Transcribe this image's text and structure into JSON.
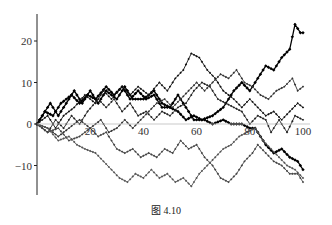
{
  "caption": "图 4.10",
  "chart_data": {
    "type": "line",
    "title": "",
    "caption": "图 4.10",
    "xlabel": "",
    "ylabel": "",
    "xlim": [
      0,
      100
    ],
    "ylim": [
      -17,
      27
    ],
    "x_ticks": [
      20,
      40,
      60,
      80,
      100
    ],
    "x_tick_labels": [
      "20",
      "40",
      "60",
      "80",
      "100"
    ],
    "y_ticks": [
      -10,
      0,
      10,
      20
    ],
    "y_tick_labels": [
      "-10",
      "0",
      "10",
      "20"
    ],
    "grid": false,
    "legend": null,
    "marker": "diamond",
    "series": [
      {
        "name": "walk-1",
        "color": "#000000",
        "weight": "bold",
        "waypoints": [
          [
            0,
            0
          ],
          [
            5,
            5
          ],
          [
            8,
            2
          ],
          [
            14,
            8
          ],
          [
            17,
            5
          ],
          [
            20,
            8
          ],
          [
            23,
            5
          ],
          [
            26,
            8
          ],
          [
            30,
            6
          ],
          [
            33,
            9
          ],
          [
            36,
            6
          ],
          [
            40,
            6
          ],
          [
            44,
            8
          ],
          [
            47,
            5
          ],
          [
            50,
            4
          ],
          [
            53,
            7
          ],
          [
            56,
            4
          ],
          [
            59,
            1
          ],
          [
            63,
            1
          ],
          [
            66,
            0
          ],
          [
            70,
            1
          ],
          [
            73,
            0
          ],
          [
            77,
            0
          ],
          [
            80,
            -1
          ],
          [
            82,
            -1
          ],
          [
            86,
            -5
          ],
          [
            89,
            -7
          ],
          [
            92,
            -6
          ],
          [
            95,
            -8
          ],
          [
            98,
            -9
          ],
          [
            100,
            -11
          ]
        ]
      },
      {
        "name": "walk-2",
        "color": "#000000",
        "weight": "bold",
        "waypoints": [
          [
            0,
            0
          ],
          [
            3,
            3
          ],
          [
            6,
            2
          ],
          [
            9,
            5
          ],
          [
            13,
            7
          ],
          [
            16,
            5
          ],
          [
            19,
            7
          ],
          [
            22,
            6
          ],
          [
            26,
            9
          ],
          [
            29,
            7
          ],
          [
            32,
            9
          ],
          [
            35,
            6
          ],
          [
            38,
            8
          ],
          [
            41,
            6
          ],
          [
            44,
            7
          ],
          [
            47,
            4
          ],
          [
            50,
            4
          ],
          [
            53,
            3
          ],
          [
            56,
            1
          ],
          [
            59,
            2
          ],
          [
            62,
            1
          ],
          [
            66,
            2
          ],
          [
            70,
            4
          ],
          [
            74,
            8
          ],
          [
            77,
            10
          ],
          [
            80,
            8
          ],
          [
            84,
            12
          ],
          [
            86,
            14
          ],
          [
            89,
            13
          ],
          [
            92,
            16
          ],
          [
            95,
            18
          ],
          [
            97,
            24
          ],
          [
            99,
            22
          ],
          [
            100,
            22
          ]
        ]
      },
      {
        "name": "walk-3",
        "color": "#111111",
        "weight": "normal",
        "waypoints": [
          [
            0,
            0
          ],
          [
            4,
            2
          ],
          [
            7,
            -1
          ],
          [
            10,
            2
          ],
          [
            14,
            4
          ],
          [
            18,
            7
          ],
          [
            22,
            5
          ],
          [
            25,
            8
          ],
          [
            28,
            6
          ],
          [
            32,
            9
          ],
          [
            35,
            7
          ],
          [
            38,
            9
          ],
          [
            42,
            7
          ],
          [
            46,
            10
          ],
          [
            49,
            8
          ],
          [
            52,
            11
          ],
          [
            55,
            13
          ],
          [
            58,
            17
          ],
          [
            61,
            16
          ],
          [
            64,
            13
          ],
          [
            67,
            11
          ],
          [
            70,
            8
          ],
          [
            74,
            6
          ],
          [
            77,
            4
          ],
          [
            80,
            6
          ],
          [
            83,
            4
          ],
          [
            86,
            2
          ],
          [
            89,
            3
          ],
          [
            92,
            1
          ],
          [
            95,
            3
          ],
          [
            98,
            5
          ],
          [
            100,
            4
          ]
        ]
      },
      {
        "name": "walk-4",
        "color": "#222222",
        "weight": "normal",
        "waypoints": [
          [
            0,
            0
          ],
          [
            4,
            -2
          ],
          [
            7,
            1
          ],
          [
            10,
            -1
          ],
          [
            13,
            2
          ],
          [
            16,
            0
          ],
          [
            19,
            3
          ],
          [
            23,
            6
          ],
          [
            26,
            4
          ],
          [
            29,
            6
          ],
          [
            32,
            3
          ],
          [
            35,
            5
          ],
          [
            38,
            2
          ],
          [
            41,
            3
          ],
          [
            44,
            1
          ],
          [
            47,
            3
          ],
          [
            50,
            2
          ],
          [
            53,
            4
          ],
          [
            56,
            5
          ],
          [
            59,
            8
          ],
          [
            62,
            10
          ],
          [
            65,
            9
          ],
          [
            68,
            6
          ],
          [
            71,
            5
          ],
          [
            74,
            4
          ],
          [
            77,
            3
          ],
          [
            80,
            0
          ],
          [
            83,
            2
          ],
          [
            86,
            1
          ],
          [
            88,
            -2
          ],
          [
            91,
            1
          ],
          [
            94,
            -2
          ],
          [
            97,
            2
          ],
          [
            100,
            1
          ]
        ]
      },
      {
        "name": "walk-5",
        "color": "#333333",
        "weight": "normal",
        "waypoints": [
          [
            0,
            0
          ],
          [
            4,
            -1
          ],
          [
            8,
            -3
          ],
          [
            12,
            -1
          ],
          [
            16,
            1
          ],
          [
            20,
            -1
          ],
          [
            24,
            1
          ],
          [
            27,
            -2
          ],
          [
            30,
            -1
          ],
          [
            33,
            1
          ],
          [
            36,
            -1
          ],
          [
            39,
            1
          ],
          [
            42,
            3
          ],
          [
            45,
            5
          ],
          [
            48,
            6
          ],
          [
            51,
            4
          ],
          [
            54,
            6
          ],
          [
            57,
            8
          ],
          [
            60,
            10
          ],
          [
            63,
            8
          ],
          [
            66,
            10
          ],
          [
            69,
            12
          ],
          [
            72,
            11
          ],
          [
            75,
            13
          ],
          [
            78,
            10
          ],
          [
            81,
            9
          ],
          [
            84,
            7
          ],
          [
            87,
            6
          ],
          [
            90,
            8
          ],
          [
            93,
            9
          ],
          [
            96,
            11
          ],
          [
            98,
            8
          ],
          [
            100,
            9
          ]
        ]
      },
      {
        "name": "walk-6",
        "color": "#444444",
        "weight": "normal",
        "waypoints": [
          [
            0,
            0
          ],
          [
            4,
            -2
          ],
          [
            8,
            -1
          ],
          [
            12,
            -4
          ],
          [
            16,
            -3
          ],
          [
            20,
            -1
          ],
          [
            23,
            -3
          ],
          [
            26,
            -2
          ],
          [
            30,
            -6
          ],
          [
            33,
            -7
          ],
          [
            36,
            -6
          ],
          [
            39,
            -8
          ],
          [
            42,
            -7
          ],
          [
            45,
            -8
          ],
          [
            48,
            -6
          ],
          [
            51,
            -7
          ],
          [
            54,
            -4
          ],
          [
            57,
            -6
          ],
          [
            60,
            -5
          ],
          [
            63,
            -8
          ],
          [
            66,
            -10
          ],
          [
            69,
            -13
          ],
          [
            72,
            -14
          ],
          [
            75,
            -12
          ],
          [
            78,
            -9
          ],
          [
            81,
            -7
          ],
          [
            83,
            -5
          ],
          [
            86,
            -7
          ],
          [
            89,
            -9
          ],
          [
            92,
            -10
          ],
          [
            95,
            -12
          ],
          [
            98,
            -12
          ],
          [
            100,
            -14
          ]
        ]
      },
      {
        "name": "walk-7",
        "color": "#555555",
        "weight": "normal",
        "waypoints": [
          [
            0,
            0
          ],
          [
            4,
            -1
          ],
          [
            8,
            -4
          ],
          [
            12,
            -3
          ],
          [
            15,
            -5
          ],
          [
            18,
            -6
          ],
          [
            22,
            -7
          ],
          [
            25,
            -9
          ],
          [
            28,
            -11
          ],
          [
            31,
            -13
          ],
          [
            34,
            -14
          ],
          [
            37,
            -12
          ],
          [
            40,
            -13
          ],
          [
            43,
            -11
          ],
          [
            46,
            -13
          ],
          [
            49,
            -12
          ],
          [
            52,
            -14
          ],
          [
            55,
            -13
          ],
          [
            58,
            -15
          ],
          [
            61,
            -12
          ],
          [
            64,
            -10
          ],
          [
            67,
            -8
          ],
          [
            70,
            -6
          ],
          [
            73,
            -5
          ],
          [
            76,
            -3
          ],
          [
            79,
            -2
          ],
          [
            82,
            -1
          ],
          [
            85,
            -4
          ],
          [
            88,
            -6
          ],
          [
            91,
            -8
          ],
          [
            94,
            -10
          ],
          [
            97,
            -11
          ],
          [
            100,
            -13
          ]
        ]
      }
    ]
  }
}
